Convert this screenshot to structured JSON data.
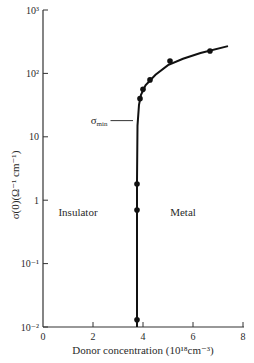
{
  "chart_data": {
    "type": "scatter",
    "title": "",
    "xlabel": "Donor concentration (10¹⁸cm⁻³)",
    "ylabel": "σ(0)(Ω⁻¹ cm⁻¹)",
    "xlim": [
      0,
      8
    ],
    "ylim": [
      0.01,
      1000
    ],
    "yscale": "log",
    "grid": false,
    "x_ticks": [
      0,
      2,
      4,
      6,
      8
    ],
    "x_tick_labels": [
      "0",
      "2",
      "4",
      "6",
      "8"
    ],
    "y_ticks": [
      0.01,
      0.1,
      1,
      10,
      100,
      1000
    ],
    "y_tick_labels": [
      "10⁻²",
      "10⁻¹",
      "1",
      "10",
      "10²",
      "10³"
    ],
    "series": [
      {
        "name": "measured",
        "points": [
          {
            "x": 3.76,
            "y": 0.013
          },
          {
            "x": 3.76,
            "y": 0.7
          },
          {
            "x": 3.76,
            "y": 1.8
          },
          {
            "x": 3.88,
            "y": 40
          },
          {
            "x": 4.0,
            "y": 56
          },
          {
            "x": 4.28,
            "y": 79
          },
          {
            "x": 5.08,
            "y": 157
          },
          {
            "x": 6.68,
            "y": 225
          }
        ]
      },
      {
        "name": "fit curve",
        "points": [
          {
            "x": 3.76,
            "y": 0.01
          },
          {
            "x": 3.76,
            "y": 2
          },
          {
            "x": 3.78,
            "y": 15
          },
          {
            "x": 3.84,
            "y": 32
          },
          {
            "x": 3.92,
            "y": 46
          },
          {
            "x": 4.1,
            "y": 65
          },
          {
            "x": 4.5,
            "y": 95
          },
          {
            "x": 5.0,
            "y": 135
          },
          {
            "x": 5.6,
            "y": 170
          },
          {
            "x": 6.3,
            "y": 210
          },
          {
            "x": 7.4,
            "y": 270
          }
        ]
      }
    ],
    "annotations": [
      {
        "text": "σ",
        "sub": "min",
        "y": 18,
        "line_x": [
          2.7,
          3.6
        ]
      },
      {
        "text": "Insulator",
        "x": 1.4,
        "y": 0.65
      },
      {
        "text": "Metal",
        "x": 5.6,
        "y": 0.65
      }
    ]
  }
}
